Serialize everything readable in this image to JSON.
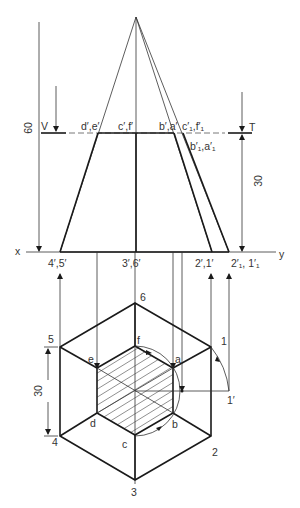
{
  "figure": {
    "type": "orthographic-projection",
    "colors": {
      "line": "#1a1a1a",
      "thin_line": "#333333",
      "hatch": "#444444",
      "background": "#ffffff"
    }
  },
  "front_view": {
    "dimension_height": "60",
    "dimension_cut": "30",
    "plane_labels": {
      "v": "V",
      "t": "T"
    },
    "section_labels": {
      "de": "d′,e′",
      "cf": "c′,f′",
      "ba": "b′,a′",
      "c1f1": "c′₁,f′₁",
      "b1a1": "b′₁,a′₁"
    },
    "xy_line": {
      "x": "x",
      "y": "y"
    },
    "base_labels": {
      "p45": "4′,5′",
      "p36": "3′,6′",
      "p21": "2′,1′",
      "p2111": "2′₁, 1′₁"
    }
  },
  "top_view": {
    "dimension_side": "30",
    "corner_labels": [
      "1",
      "2",
      "3",
      "4",
      "5",
      "6"
    ],
    "section_labels": [
      "a",
      "b",
      "c",
      "d",
      "e",
      "f"
    ],
    "rotated_point": "1′"
  }
}
